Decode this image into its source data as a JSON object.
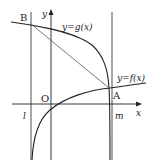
{
  "diagram": {
    "type": "function-graph",
    "axes": {
      "x_label": "x",
      "y_label": "y",
      "origin_label": "O"
    },
    "curves": [
      {
        "name": "g",
        "label": "y=g(x)"
      },
      {
        "name": "f",
        "label": "y=f(x)"
      }
    ],
    "vertical_lines": [
      {
        "name": "l",
        "label": "l"
      },
      {
        "name": "m",
        "label": "m"
      }
    ],
    "points": [
      {
        "name": "B",
        "label": "B"
      },
      {
        "name": "A",
        "label": "A"
      }
    ],
    "segments": [
      {
        "from": "B",
        "to": "A"
      }
    ],
    "colors": {
      "stroke": "#222222",
      "segment": "#555555"
    }
  }
}
